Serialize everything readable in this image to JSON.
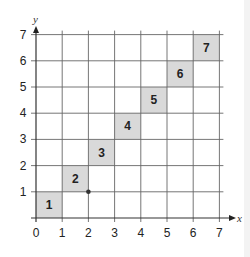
{
  "chart_data": {
    "type": "scatter",
    "title": "",
    "xlabel": "x",
    "ylabel": "y",
    "xlim": [
      0,
      7
    ],
    "ylim": [
      0,
      7
    ],
    "grid": true,
    "x_ticks": [
      "0",
      "1",
      "2",
      "3",
      "4",
      "5",
      "6",
      "7"
    ],
    "y_ticks": [
      "1",
      "2",
      "3",
      "4",
      "5",
      "6",
      "7"
    ],
    "shaded_squares": [
      {
        "label": "1",
        "x": 0,
        "y": 0
      },
      {
        "label": "2",
        "x": 1,
        "y": 1
      },
      {
        "label": "3",
        "x": 2,
        "y": 2
      },
      {
        "label": "4",
        "x": 3,
        "y": 3
      },
      {
        "label": "5",
        "x": 4,
        "y": 4
      },
      {
        "label": "6",
        "x": 5,
        "y": 5
      },
      {
        "label": "7",
        "x": 6,
        "y": 6
      }
    ],
    "points": [
      {
        "x": 2,
        "y": 1
      }
    ],
    "colors": {
      "square_fill": "#d9d9d9",
      "grid": "#555555",
      "text": "#222222"
    }
  }
}
